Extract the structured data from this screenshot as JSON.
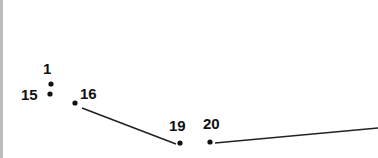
{
  "puzzle": {
    "type": "connect-the-dots",
    "points": [
      {
        "label": "1",
        "x": 51,
        "y": 84,
        "lx": 43,
        "ly": 61
      },
      {
        "label": "15",
        "x": 50,
        "y": 94,
        "lx": 21,
        "ly": 87
      },
      {
        "label": "16",
        "x": 75,
        "y": 103,
        "lx": 80,
        "ly": 86
      },
      {
        "label": "19",
        "x": 180,
        "y": 143,
        "lx": 169,
        "ly": 118
      },
      {
        "label": "20",
        "x": 210,
        "y": 142,
        "lx": 203,
        "ly": 116
      }
    ],
    "segments": [
      {
        "x1": 82,
        "y1": 108,
        "x2": 176,
        "y2": 144
      },
      {
        "x1": 215,
        "y1": 143,
        "x2": 378,
        "y2": 128
      }
    ],
    "colors": {
      "ink": "#111111",
      "line": "#222222",
      "edge": "#bdbdbd"
    }
  }
}
